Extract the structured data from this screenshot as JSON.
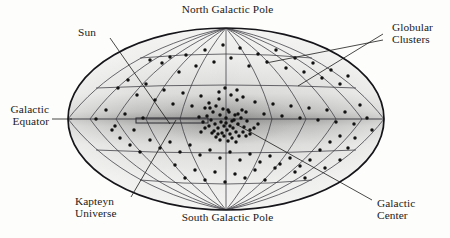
{
  "figure": {
    "projection": "Mollweide elliptical equal-area projection of the celestial sphere in galactic coordinates",
    "background_color": "#fdfdfb",
    "outline_color": "#15151a",
    "dot_color": "#111111",
    "fill_light": "#f2f2f0",
    "fill_dark": "#8e8e8e"
  },
  "labels": {
    "north_pole": "North Galactic Pole",
    "south_pole": "South Galactic Pole",
    "sun": "Sun",
    "galactic_equator_l1": "Galactic",
    "galactic_equator_l2": "Equator",
    "globular_clusters_l1": "Globular",
    "globular_clusters_l2": "Clusters",
    "kapteyn_l1": "Kapteyn",
    "kapteyn_l2": "Universe",
    "galactic_center_l1": "Galactic",
    "galactic_center_l2": "Center"
  },
  "chart_data": {
    "type": "scatter",
    "xlabel": "Galactic longitude",
    "ylabel": "Galactic latitude",
    "projection": "mollweide",
    "grid": true,
    "legend": "none",
    "xlim": [
      -180,
      180
    ],
    "ylim": [
      -90,
      90
    ],
    "ellipse": {
      "cx": 226,
      "cy": 119,
      "rx": 158,
      "ry": 91
    },
    "meridian_count": 11,
    "meridian_spacing_deg": 30,
    "parallel_count": 5,
    "parallel_spacing_deg": 30,
    "annotations": [
      {
        "name": "north-galactic-pole",
        "text": "North Galactic Pole",
        "target": [
          226,
          28
        ]
      },
      {
        "name": "south-galactic-pole",
        "text": "South Galactic Pole",
        "target": [
          226,
          210
        ]
      },
      {
        "name": "sun",
        "text": "Sun",
        "target": [
          166,
          121
        ]
      },
      {
        "name": "galactic-equator",
        "text": "Galactic Equator",
        "target": [
          70,
          119
        ]
      },
      {
        "name": "globular-clusters",
        "text": "Globular Clusters",
        "target": [
          [
            300,
            86
          ],
          [
            268,
            62
          ]
        ]
      },
      {
        "name": "kapteyn-universe",
        "text": "Kapteyn Universe",
        "target": [
          172,
          121
        ]
      },
      {
        "name": "galactic-center",
        "text": "Galactic Center",
        "target": [
          226,
          120
        ]
      }
    ],
    "kapteyn_universe_rect": {
      "x": 136,
      "y": 118,
      "width": 72,
      "height": 5
    },
    "points_note": "Globular cluster sky positions; strong concentration toward the galactic center at image center.",
    "points": [
      [
        150,
        60
      ],
      [
        162,
        63
      ],
      [
        170,
        57
      ],
      [
        179,
        72
      ],
      [
        186,
        55
      ],
      [
        196,
        66
      ],
      [
        205,
        50
      ],
      [
        214,
        62
      ],
      [
        223,
        45
      ],
      [
        231,
        58
      ],
      [
        240,
        48
      ],
      [
        249,
        66
      ],
      [
        258,
        54
      ],
      [
        267,
        62
      ],
      [
        276,
        50
      ],
      [
        286,
        68
      ],
      [
        295,
        58
      ],
      [
        304,
        72
      ],
      [
        313,
        63
      ],
      [
        322,
        78
      ],
      [
        331,
        70
      ],
      [
        340,
        84
      ],
      [
        348,
        76
      ],
      [
        118,
        88
      ],
      [
        128,
        80
      ],
      [
        137,
        95
      ],
      [
        146,
        84
      ],
      [
        155,
        100
      ],
      [
        164,
        90
      ],
      [
        173,
        104
      ],
      [
        183,
        93
      ],
      [
        192,
        106
      ],
      [
        201,
        96
      ],
      [
        210,
        108
      ],
      [
        219,
        99
      ],
      [
        228,
        110
      ],
      [
        237,
        100
      ],
      [
        246,
        112
      ],
      [
        255,
        102
      ],
      [
        264,
        114
      ],
      [
        273,
        104
      ],
      [
        282,
        116
      ],
      [
        291,
        106
      ],
      [
        300,
        118
      ],
      [
        309,
        108
      ],
      [
        318,
        120
      ],
      [
        327,
        110
      ],
      [
        336,
        122
      ],
      [
        345,
        112
      ],
      [
        354,
        124
      ],
      [
        96,
        119
      ],
      [
        106,
        110
      ],
      [
        115,
        126
      ],
      [
        125,
        114
      ],
      [
        134,
        130
      ],
      [
        143,
        118
      ],
      [
        360,
        105
      ],
      [
        367,
        118
      ],
      [
        372,
        130
      ],
      [
        205,
        108
      ],
      [
        209,
        103
      ],
      [
        213,
        112
      ],
      [
        216,
        106
      ],
      [
        220,
        115
      ],
      [
        223,
        109
      ],
      [
        226,
        118
      ],
      [
        229,
        112
      ],
      [
        232,
        121
      ],
      [
        235,
        115
      ],
      [
        238,
        124
      ],
      [
        241,
        118
      ],
      [
        244,
        127
      ],
      [
        247,
        121
      ],
      [
        250,
        130
      ],
      [
        211,
        120
      ],
      [
        215,
        124
      ],
      [
        218,
        128
      ],
      [
        221,
        122
      ],
      [
        224,
        126
      ],
      [
        227,
        130
      ],
      [
        230,
        134
      ],
      [
        233,
        128
      ],
      [
        236,
        132
      ],
      [
        239,
        136
      ],
      [
        207,
        116
      ],
      [
        203,
        122
      ],
      [
        199,
        117
      ],
      [
        212,
        133
      ],
      [
        216,
        137
      ],
      [
        220,
        140
      ],
      [
        224,
        136
      ],
      [
        228,
        141
      ],
      [
        232,
        138
      ],
      [
        236,
        142
      ],
      [
        243,
        132
      ],
      [
        246,
        136
      ],
      [
        250,
        134
      ],
      [
        254,
        128
      ],
      [
        258,
        124
      ],
      [
        205,
        128
      ],
      [
        201,
        132
      ],
      [
        209,
        126
      ],
      [
        214,
        131
      ],
      [
        218,
        134
      ],
      [
        222,
        133
      ],
      [
        226,
        123
      ],
      [
        230,
        126
      ],
      [
        234,
        120
      ],
      [
        238,
        114
      ],
      [
        242,
        110
      ],
      [
        219,
        92
      ],
      [
        225,
        88
      ],
      [
        231,
        95
      ],
      [
        237,
        90
      ],
      [
        243,
        97
      ],
      [
        150,
        140
      ],
      [
        160,
        148
      ],
      [
        170,
        142
      ],
      [
        180,
        152
      ],
      [
        190,
        145
      ],
      [
        200,
        155
      ],
      [
        210,
        150
      ],
      [
        220,
        158
      ],
      [
        230,
        152
      ],
      [
        240,
        160
      ],
      [
        250,
        154
      ],
      [
        260,
        162
      ],
      [
        270,
        156
      ],
      [
        280,
        164
      ],
      [
        290,
        158
      ],
      [
        300,
        166
      ],
      [
        310,
        160
      ],
      [
        320,
        150
      ],
      [
        330,
        142
      ],
      [
        340,
        136
      ],
      [
        130,
        145
      ],
      [
        140,
        152
      ],
      [
        120,
        138
      ],
      [
        112,
        130
      ],
      [
        175,
        165
      ],
      [
        195,
        170
      ],
      [
        215,
        172
      ],
      [
        235,
        174
      ],
      [
        255,
        170
      ],
      [
        275,
        168
      ],
      [
        295,
        172
      ],
      [
        205,
        180
      ],
      [
        225,
        182
      ],
      [
        245,
        178
      ],
      [
        185,
        178
      ],
      [
        265,
        180
      ],
      [
        348,
        148
      ],
      [
        355,
        138
      ],
      [
        340,
        160
      ],
      [
        325,
        168
      ],
      [
        305,
        178
      ]
    ]
  }
}
